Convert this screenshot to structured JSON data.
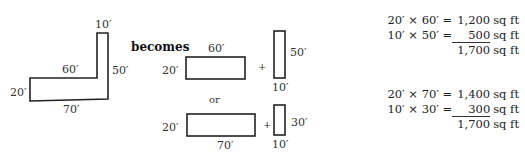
{
  "l_shape": {
    "labels": {
      "top": "10′",
      "inner": "60′",
      "right": "50′",
      "left": "20′",
      "bottom": "70′"
    }
  },
  "connector": "becomes",
  "option_a": {
    "rect1": {
      "top": "60′",
      "left": "20′"
    },
    "plus": "+",
    "rect2": {
      "right": "50′",
      "bottom": "10′"
    }
  },
  "separator": "or",
  "option_b": {
    "rect1": {
      "left": "20′",
      "bottom": "70′"
    },
    "plus": "+",
    "rect2": {
      "right": "30′",
      "bottom": "10′"
    }
  },
  "calc_a": {
    "line1": {
      "expr": "20′ × 60′ =",
      "value": "1,200",
      "unit": "sq ft"
    },
    "line2": {
      "expr": "10′ × 50′ =",
      "value": "500",
      "unit": "sq ft"
    },
    "total": {
      "value": "1,700",
      "unit": "sq ft"
    }
  },
  "calc_b": {
    "line1": {
      "expr": "20′ × 70′ =",
      "value": "1,400",
      "unit": "sq ft"
    },
    "line2": {
      "expr": "10′ × 30′ =",
      "value": "300",
      "unit": "sq ft"
    },
    "total": {
      "value": "1,700",
      "unit": "sq ft"
    }
  },
  "colors": {
    "stroke": "#222222",
    "text": "#333333"
  }
}
